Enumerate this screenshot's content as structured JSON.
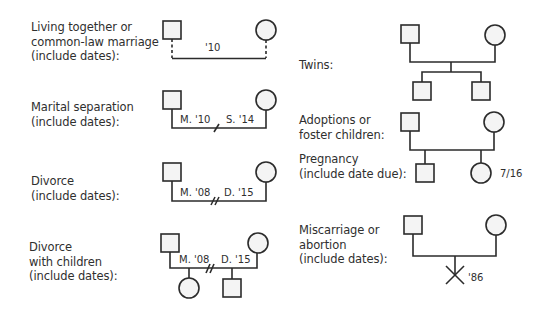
{
  "legend": {
    "living_together": {
      "label_lines": [
        "Living together or",
        "common-law marriage",
        "(include dates):"
      ],
      "date": "'10"
    },
    "marital_separation": {
      "label_lines": [
        "Marital separation",
        "(include dates):"
      ],
      "married": "M. '10",
      "separated": "S. '14"
    },
    "divorce": {
      "label_lines": [
        "Divorce",
        "(include dates):"
      ],
      "married": "M. '08",
      "divorced": "D. '15"
    },
    "divorce_children": {
      "label_lines": [
        "Divorce",
        "with children",
        "(include dates):"
      ],
      "married": "M. '08",
      "divorced": "D. '15"
    },
    "twins": {
      "label_lines": [
        "Twins:"
      ]
    },
    "adoptions": {
      "label_lines": [
        "Adoptions or",
        "foster children:"
      ]
    },
    "pregnancy": {
      "label_lines": [
        "Pregnancy",
        "(include date due):"
      ],
      "due": "7/16"
    },
    "miscarriage": {
      "label_lines": [
        "Miscarriage or",
        "abortion",
        "(include dates):"
      ],
      "date": "'86"
    }
  },
  "symbols": {
    "male": "square",
    "female": "circle",
    "separation": "single-slash",
    "divorce": "double-slash",
    "miscarriage": "x-mark"
  },
  "colors": {
    "stroke": "#2b2b2b",
    "fill": "#f4f4f4",
    "text": "#2f2f2f"
  }
}
